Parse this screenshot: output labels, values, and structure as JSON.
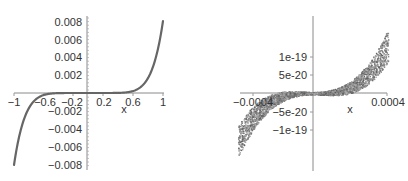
{
  "chart_data": [
    {
      "type": "line",
      "title": "",
      "xlabel": "x",
      "ylabel": "",
      "xlim": [
        -1,
        1
      ],
      "ylim": [
        -0.008,
        0.008
      ],
      "x_ticks": [
        "-1",
        "-0.6",
        "-0.2",
        "0.2",
        "0.6",
        "1"
      ],
      "y_ticks": [
        "0.008",
        "0.006",
        "0.004",
        "0.002",
        "-0.002",
        "-0.004",
        "-0.006",
        "-0.008"
      ],
      "grid": false,
      "legend": null,
      "series": [
        {
          "name": "f(x)",
          "description": "odd, approximately 0.008*x^7 shaped curve",
          "x": [
            -1,
            -0.9,
            -0.8,
            -0.7,
            -0.6,
            -0.5,
            -0.4,
            -0.2,
            0,
            0.2,
            0.4,
            0.5,
            0.6,
            0.7,
            0.8,
            0.9,
            1
          ],
          "y": [
            -0.008,
            -0.0038,
            -0.0017,
            -0.00066,
            -0.00022,
            -6e-05,
            -1e-05,
            0,
            0,
            0,
            1e-05,
            6e-05,
            0.00022,
            0.00066,
            0.0017,
            0.0038,
            0.008
          ],
          "color": "#666666"
        }
      ]
    },
    {
      "type": "line",
      "title": "",
      "xlabel": "x",
      "ylabel": "",
      "xlim": [
        -0.00045,
        0.00045
      ],
      "ylim": [
        -2.2e-19,
        2.2e-19
      ],
      "x_ticks": [
        "-0.0004",
        "0.0004"
      ],
      "y_ticks": [
        "1e-19",
        "5e-20",
        "-5e-20",
        "-1e-19"
      ],
      "grid": false,
      "legend": null,
      "series": [
        {
          "name": "f(x) numerical noise band",
          "description": "noisy band around an odd cubic-like curve, width growing with |x|",
          "x": [
            -0.00045,
            -0.0004,
            -0.0003,
            -0.0002,
            -0.0001,
            0,
            0.0001,
            0.0002,
            0.0003,
            0.0004,
            0.00045
          ],
          "y": [
            -1.3e-19,
            -9e-20,
            -3.5e-20,
            -1e-20,
            -2e-21,
            0,
            2e-21,
            1e-20,
            3.5e-20,
            9e-20,
            1.3e-19
          ],
          "color": "#7a7a7a"
        }
      ]
    }
  ],
  "left_plot": {
    "x_label": "x",
    "x_ticks": [
      {
        "label": "-1",
        "x": 14
      },
      {
        "label": "-0.6",
        "x": 45
      },
      {
        "label": "-0.2",
        "x": 73
      },
      {
        "label": "0.2",
        "x": 103
      },
      {
        "label": "0.6",
        "x": 133
      },
      {
        "label": "1",
        "x": 163
      }
    ],
    "y_ticks": [
      {
        "label": "0.008",
        "y": 22
      },
      {
        "label": "0.006",
        "y": 40
      },
      {
        "label": "0.004",
        "y": 57
      },
      {
        "label": "0.002",
        "y": 75
      },
      {
        "label": "-0.002",
        "y": 111
      },
      {
        "label": "-0.004",
        "y": 129
      },
      {
        "label": "-0.006",
        "y": 147
      },
      {
        "label": "-0.008",
        "y": 165
      }
    ]
  },
  "right_plot": {
    "x_label": "x",
    "x_ticks": [
      {
        "label": "-0.0004",
        "x": 253
      },
      {
        "label": "0.0004",
        "x": 388
      }
    ],
    "y_ticks": [
      {
        "label": "1e-19",
        "y": 57
      },
      {
        "label": "5e-20",
        "y": 75
      },
      {
        "label": "-5e-20",
        "y": 112
      },
      {
        "label": "-1e-19",
        "y": 130
      }
    ]
  }
}
